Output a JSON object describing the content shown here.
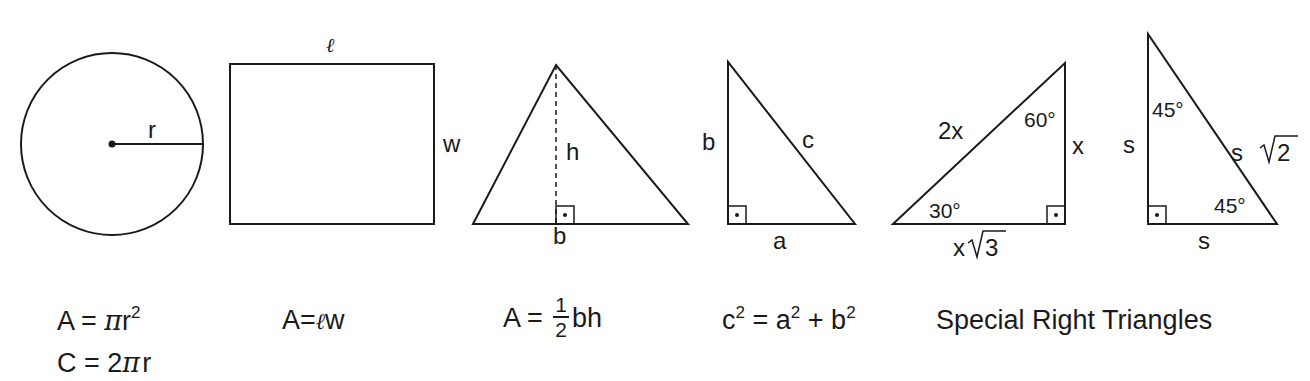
{
  "figures": {
    "circle": {
      "radius_label": "r"
    },
    "rectangle": {
      "length_label": "ℓ",
      "width_label": "w"
    },
    "triangle": {
      "height_label": "h",
      "base_label": "b"
    },
    "pythagorean": {
      "leg_b_label": "b",
      "leg_a_label": "a",
      "hypotenuse_label": "c"
    },
    "triangle_30_60_90": {
      "hypotenuse_label": "2x",
      "short_leg_label": "x",
      "long_leg_label": "x√3",
      "long_leg_prefix": "x",
      "long_leg_radicand": "3",
      "angle_top": "60°",
      "angle_bottom": "30°"
    },
    "triangle_45_45_90": {
      "leg_vertical_label": "s",
      "leg_horizontal_label": "s",
      "hypotenuse_prefix": "s",
      "hypotenuse_radicand": "2",
      "angle_top": "45°",
      "angle_bottom": "45°"
    }
  },
  "formulas": {
    "circle_area": {
      "lhs": "A",
      "eq": "=",
      "pi": "π",
      "var": "r",
      "exp": "2"
    },
    "circle_circumference": {
      "lhs": "C",
      "eq": "=",
      "coef": "2",
      "pi": "π",
      "var": "r"
    },
    "rectangle_area": {
      "lhs": "A",
      "eq": "=",
      "l": "ℓ",
      "w": "w"
    },
    "triangle_area": {
      "lhs": "A",
      "eq": "=",
      "num": "1",
      "den": "2",
      "rest": "bh"
    },
    "pythagorean": {
      "c": "c",
      "c_exp": "2",
      "eq": "=",
      "a": "a",
      "a_exp": "2",
      "plus": "+",
      "b": "b",
      "b_exp": "2"
    },
    "special_caption": "Special Right Triangles"
  }
}
